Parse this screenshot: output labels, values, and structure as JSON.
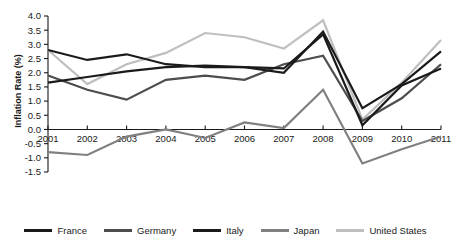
{
  "chart_data": {
    "type": "line",
    "title": "",
    "xlabel": "",
    "ylabel": "Inflation Rate (%)",
    "x": [
      2001,
      2002,
      2003,
      2004,
      2005,
      2006,
      2007,
      2008,
      2009,
      2010,
      2011
    ],
    "xtick_labels": [
      "2001",
      "2002",
      "2003",
      "2004",
      "2005",
      "2006",
      "2007",
      "2008",
      "2009",
      "2010",
      "2011"
    ],
    "ytick_labels": [
      "-1.5",
      "-1.0",
      "-0.5",
      "0.0",
      "0.5",
      "1.0",
      "1.5",
      "2.0",
      "2.5",
      "3.0",
      "3.5",
      "4.0"
    ],
    "yticks": [
      -1.5,
      -1.0,
      -0.5,
      0.0,
      0.5,
      1.0,
      1.5,
      2.0,
      2.5,
      3.0,
      3.5,
      4.0
    ],
    "ylim": [
      -1.5,
      4.0
    ],
    "xlim": [
      2001,
      2011
    ],
    "grid": false,
    "legend_position": "bottom",
    "series": [
      {
        "name": "France",
        "color": "#1a1a1a",
        "values": [
          1.65,
          1.85,
          2.05,
          2.2,
          2.25,
          2.2,
          2.15,
          3.35,
          0.15,
          1.55,
          2.15
        ]
      },
      {
        "name": "Germany",
        "color": "#4d4d4d",
        "values": [
          1.9,
          1.4,
          1.05,
          1.75,
          1.9,
          1.75,
          2.3,
          2.6,
          0.3,
          1.1,
          2.3
        ]
      },
      {
        "name": "Italy",
        "color": "#1a1a1a",
        "values": [
          2.8,
          2.45,
          2.65,
          2.3,
          2.2,
          2.2,
          2.0,
          3.45,
          0.75,
          1.6,
          2.75
        ]
      },
      {
        "name": "Japan",
        "color": "#808080",
        "values": [
          -0.8,
          -0.9,
          -0.25,
          0.0,
          -0.3,
          0.25,
          0.05,
          1.4,
          -1.2,
          -0.7,
          -0.25
        ]
      },
      {
        "name": "United States",
        "color": "#bfbfbf",
        "values": [
          2.8,
          1.6,
          2.3,
          2.7,
          3.4,
          3.25,
          2.85,
          3.85,
          0.35,
          1.65,
          3.15
        ]
      }
    ]
  },
  "legend": {
    "entries": [
      {
        "label": "France",
        "color": "#1a1a1a"
      },
      {
        "label": "Germany",
        "color": "#4d4d4d"
      },
      {
        "label": "Italy",
        "color": "#1a1a1a"
      },
      {
        "label": "Japan",
        "color": "#808080"
      },
      {
        "label": "United States",
        "color": "#bfbfbf"
      }
    ]
  }
}
